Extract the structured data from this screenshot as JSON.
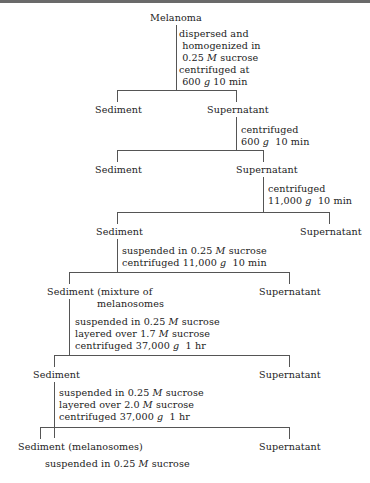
{
  "diagram": {
    "type": "flowchart",
    "title": "Melanoma",
    "nodes": {
      "root": "Melanoma",
      "sediment_1": "Sediment",
      "supernatant_1": "Supernatant",
      "sediment_2": "Sediment",
      "supernatant_2": "Supernatant",
      "sediment_3": "Sediment",
      "supernatant_3": "Supernatant",
      "sediment_4": "Sediment (mixture of",
      "sediment_4_cont": "melanosomes",
      "supernatant_4": "Supernatant",
      "sediment_5": "Sediment",
      "supernatant_5": "Supernatant",
      "sediment_6": "Sediment (melanosomes)",
      "supernatant_6": "Supernatant"
    },
    "steps": {
      "step1": [
        "dispersed and",
        " homogenized in",
        " 0.25 M sucrose",
        "centrifuged at",
        " 600 g 10 min"
      ],
      "step2": [
        "centrifuged",
        "600 g  10 min"
      ],
      "step3": [
        "centrifuged",
        "11,000 g  10 min"
      ],
      "step4": [
        "suspended in 0.25 M sucrose",
        "centrifuged 11,000 g  10 min"
      ],
      "step5": [
        "suspended in 0.25 M sucrose",
        "layered over 1.7 M sucrose",
        "centrifuged 37,000 g  1 hr"
      ],
      "step6": [
        "suspended in 0.25 M sucrose",
        "layered over 2.0 M sucrose",
        "centrifuged 37,000 g  1 hr"
      ],
      "final": "suspended in 0.25 M sucrose"
    }
  }
}
